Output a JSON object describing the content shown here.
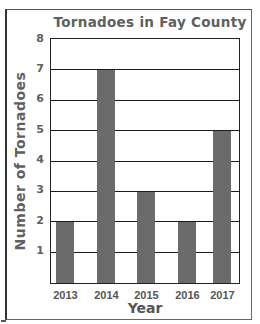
{
  "chart_data": {
    "type": "bar",
    "title": "Tornadoes in Fay County",
    "xlabel": "Year",
    "ylabel": "Number of Tornadoes",
    "categories": [
      "2013",
      "2014",
      "2015",
      "2016",
      "2017"
    ],
    "values": [
      2,
      7,
      3,
      2,
      5
    ],
    "ylim": [
      0,
      8
    ],
    "yticks": [
      "1",
      "2",
      "3",
      "4",
      "5",
      "6",
      "7",
      "8"
    ],
    "grid": true,
    "legend": null,
    "bar_color": "#6b6b6b"
  }
}
